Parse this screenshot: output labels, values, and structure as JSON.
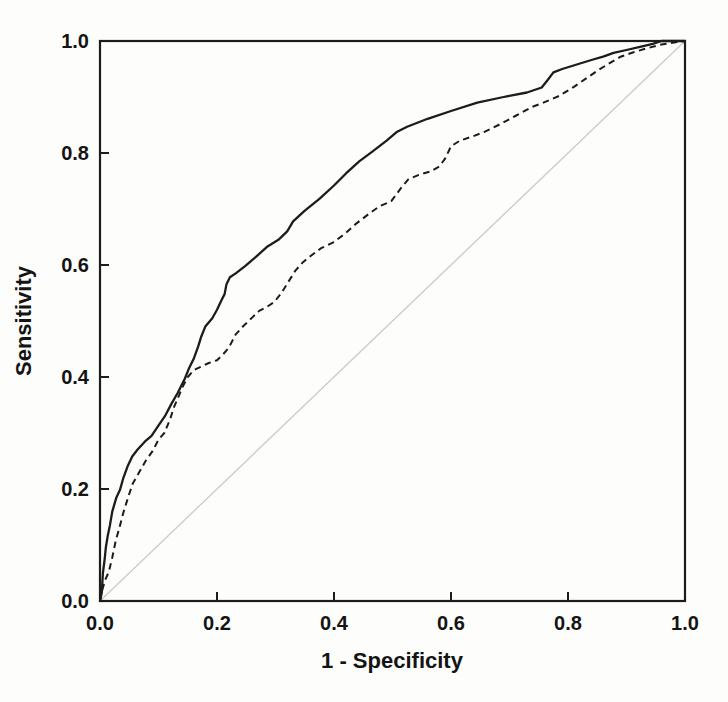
{
  "figure": {
    "type": "roc-plot"
  },
  "chart_data": {
    "type": "line",
    "title": "",
    "xlabel": "1 - Specificity",
    "ylabel": "Sensitivity",
    "xlim": [
      0,
      1
    ],
    "ylim": [
      0,
      1
    ],
    "x_ticks": [
      "0.0",
      "0.2",
      "0.4",
      "0.6",
      "0.8",
      "1.0"
    ],
    "y_ticks": [
      "0.0",
      "0.2",
      "0.4",
      "0.6",
      "0.8",
      "1.0"
    ],
    "grid": false,
    "legend_position": "none",
    "frame": "box",
    "colors": {
      "curves": "#1c1c1c",
      "reference_line": "#cdcdcd",
      "frame": "#1c1c1c"
    },
    "reference": {
      "name": "chance-diagonal",
      "style": "reference",
      "points": [
        [
          0,
          0
        ],
        [
          1,
          1
        ]
      ]
    },
    "series": [
      {
        "name": "roc-curve-solid",
        "style": "solid",
        "points": [
          [
            0,
            0
          ],
          [
            0.003,
            0.015
          ],
          [
            0.005,
            0.05
          ],
          [
            0.008,
            0.075
          ],
          [
            0.01,
            0.095
          ],
          [
            0.013,
            0.115
          ],
          [
            0.017,
            0.135
          ],
          [
            0.021,
            0.16
          ],
          [
            0.028,
            0.185
          ],
          [
            0.034,
            0.198
          ],
          [
            0.04,
            0.22
          ],
          [
            0.047,
            0.24
          ],
          [
            0.055,
            0.258
          ],
          [
            0.064,
            0.27
          ],
          [
            0.077,
            0.285
          ],
          [
            0.088,
            0.295
          ],
          [
            0.099,
            0.312
          ],
          [
            0.111,
            0.33
          ],
          [
            0.122,
            0.352
          ],
          [
            0.133,
            0.372
          ],
          [
            0.145,
            0.397
          ],
          [
            0.152,
            0.415
          ],
          [
            0.16,
            0.432
          ],
          [
            0.168,
            0.455
          ],
          [
            0.173,
            0.472
          ],
          [
            0.18,
            0.49
          ],
          [
            0.192,
            0.505
          ],
          [
            0.2,
            0.52
          ],
          [
            0.208,
            0.538
          ],
          [
            0.213,
            0.548
          ],
          [
            0.216,
            0.565
          ],
          [
            0.222,
            0.578
          ],
          [
            0.232,
            0.585
          ],
          [
            0.248,
            0.598
          ],
          [
            0.266,
            0.614
          ],
          [
            0.285,
            0.632
          ],
          [
            0.305,
            0.645
          ],
          [
            0.32,
            0.66
          ],
          [
            0.33,
            0.678
          ],
          [
            0.35,
            0.697
          ],
          [
            0.375,
            0.718
          ],
          [
            0.4,
            0.742
          ],
          [
            0.42,
            0.763
          ],
          [
            0.443,
            0.785
          ],
          [
            0.465,
            0.802
          ],
          [
            0.49,
            0.822
          ],
          [
            0.508,
            0.838
          ],
          [
            0.525,
            0.847
          ],
          [
            0.56,
            0.861
          ],
          [
            0.6,
            0.875
          ],
          [
            0.645,
            0.89
          ],
          [
            0.69,
            0.9
          ],
          [
            0.73,
            0.908
          ],
          [
            0.755,
            0.917
          ],
          [
            0.765,
            0.93
          ],
          [
            0.775,
            0.944
          ],
          [
            0.79,
            0.95
          ],
          [
            0.815,
            0.958
          ],
          [
            0.84,
            0.966
          ],
          [
            0.86,
            0.972
          ],
          [
            0.878,
            0.979
          ],
          [
            0.9,
            0.984
          ],
          [
            0.925,
            0.99
          ],
          [
            0.945,
            0.995
          ],
          [
            0.96,
            1
          ],
          [
            1,
            1
          ]
        ]
      },
      {
        "name": "roc-curve-dashed",
        "style": "dashed",
        "points": [
          [
            0,
            0
          ],
          [
            0.004,
            0.02
          ],
          [
            0.009,
            0.038
          ],
          [
            0.015,
            0.052
          ],
          [
            0.021,
            0.078
          ],
          [
            0.027,
            0.108
          ],
          [
            0.033,
            0.13
          ],
          [
            0.04,
            0.158
          ],
          [
            0.048,
            0.185
          ],
          [
            0.056,
            0.21
          ],
          [
            0.066,
            0.228
          ],
          [
            0.078,
            0.25
          ],
          [
            0.09,
            0.268
          ],
          [
            0.1,
            0.288
          ],
          [
            0.11,
            0.3
          ],
          [
            0.12,
            0.325
          ],
          [
            0.126,
            0.345
          ],
          [
            0.133,
            0.362
          ],
          [
            0.141,
            0.382
          ],
          [
            0.15,
            0.4
          ],
          [
            0.16,
            0.412
          ],
          [
            0.172,
            0.418
          ],
          [
            0.186,
            0.425
          ],
          [
            0.2,
            0.43
          ],
          [
            0.21,
            0.44
          ],
          [
            0.22,
            0.452
          ],
          [
            0.232,
            0.476
          ],
          [
            0.246,
            0.492
          ],
          [
            0.26,
            0.506
          ],
          [
            0.272,
            0.518
          ],
          [
            0.285,
            0.525
          ],
          [
            0.298,
            0.534
          ],
          [
            0.31,
            0.55
          ],
          [
            0.322,
            0.57
          ],
          [
            0.334,
            0.59
          ],
          [
            0.347,
            0.605
          ],
          [
            0.36,
            0.616
          ],
          [
            0.378,
            0.63
          ],
          [
            0.398,
            0.64
          ],
          [
            0.418,
            0.655
          ],
          [
            0.438,
            0.674
          ],
          [
            0.458,
            0.69
          ],
          [
            0.478,
            0.705
          ],
          [
            0.498,
            0.714
          ],
          [
            0.515,
            0.738
          ],
          [
            0.527,
            0.753
          ],
          [
            0.545,
            0.761
          ],
          [
            0.565,
            0.767
          ],
          [
            0.58,
            0.776
          ],
          [
            0.59,
            0.79
          ],
          [
            0.6,
            0.812
          ],
          [
            0.615,
            0.822
          ],
          [
            0.638,
            0.83
          ],
          [
            0.658,
            0.838
          ],
          [
            0.685,
            0.852
          ],
          [
            0.71,
            0.866
          ],
          [
            0.738,
            0.882
          ],
          [
            0.758,
            0.89
          ],
          [
            0.785,
            0.902
          ],
          [
            0.81,
            0.918
          ],
          [
            0.832,
            0.934
          ],
          [
            0.852,
            0.948
          ],
          [
            0.872,
            0.961
          ],
          [
            0.89,
            0.972
          ],
          [
            0.912,
            0.98
          ],
          [
            0.935,
            0.987
          ],
          [
            0.96,
            0.994
          ],
          [
            1,
            1
          ]
        ]
      }
    ]
  }
}
